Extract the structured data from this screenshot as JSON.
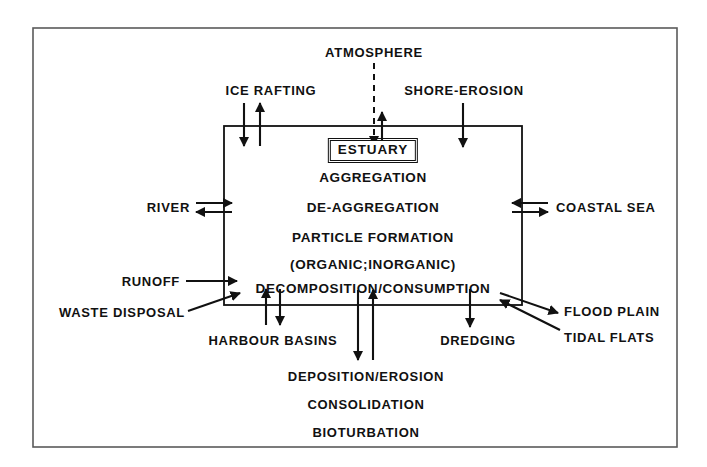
{
  "diagram": {
    "title_label": "ESTUARY",
    "outer_frame": {
      "stroke": "#5a5a5a"
    },
    "box": {
      "stroke": "#111111"
    },
    "inner_processes": [
      "AGGREGATION",
      "DE-AGGREGATION",
      "PARTICLE  FORMATION",
      "(ORGANIC;INORGANIC)",
      "DECOMPOSITION/CONSUMPTION"
    ],
    "top_labels": [
      {
        "text": "ATMOSPHERE",
        "flow": "dashed-in-and-out"
      },
      {
        "text": "ICE RAFTING",
        "flow": "in-and-out"
      },
      {
        "text": "SHORE-EROSION",
        "flow": "in"
      }
    ],
    "left_labels": [
      {
        "text": "RIVER",
        "flow": "in-and-out"
      },
      {
        "text": "RUNOFF",
        "flow": "in"
      },
      {
        "text": "WASTE DISPOSAL",
        "flow": "in"
      }
    ],
    "right_labels": [
      {
        "text": "COASTAL SEA",
        "flow": "in-and-out"
      },
      {
        "text": "FLOOD PLAIN",
        "flow": "out"
      },
      {
        "text": "TIDAL FLATS",
        "flow": "in"
      }
    ],
    "bottom_edge_labels": [
      {
        "text": "HARBOUR BASINS",
        "flow": "in-and-out"
      },
      {
        "text": "DREDGING",
        "flow": "in"
      }
    ],
    "bottom_processes": [
      "DEPOSITION/EROSION",
      "CONSOLIDATION",
      "BIOTURBATION"
    ]
  }
}
